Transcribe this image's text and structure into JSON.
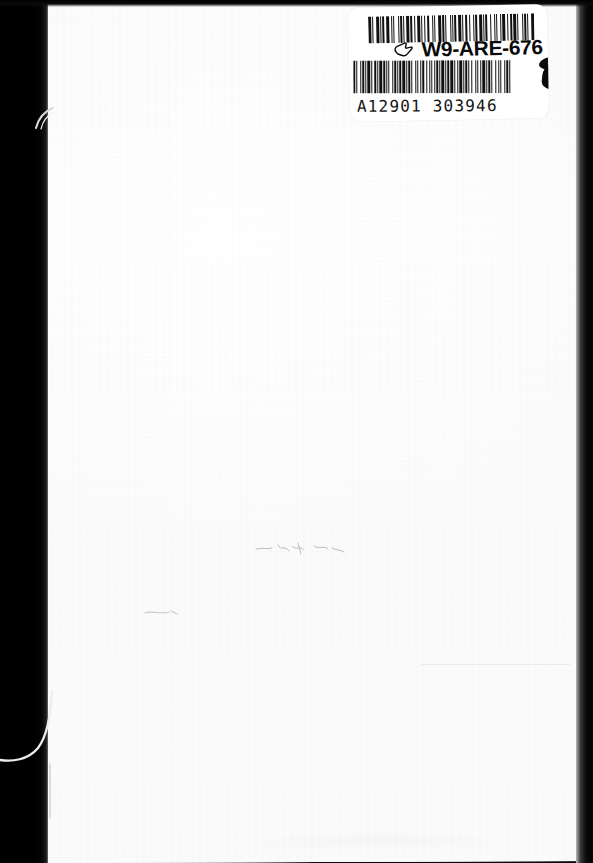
{
  "document": {
    "kind": "scanned-book-cover",
    "page_background": "#fdfdfd",
    "shadow_color": "#000000"
  },
  "label": {
    "background": "#ffffff",
    "code_text": "W9-ARE-676",
    "code_color": "#0a0a0a",
    "number_text": "A12901  303946",
    "number_color": "#151515",
    "hand_icon_name": "pointing-hand-icon",
    "barcodes": [
      {
        "name": "upper-barcode",
        "symbology": "code-39",
        "encoded_value": "W9-ARE-676",
        "bar_color": "#111111",
        "pattern": [
          3,
          1,
          1,
          2,
          3,
          1,
          1,
          1,
          2,
          1,
          3,
          2,
          1,
          1,
          1,
          3,
          1,
          1,
          2,
          1,
          1,
          1,
          3,
          1,
          2,
          2,
          1,
          1,
          3,
          1,
          1,
          2,
          1,
          1,
          2,
          3,
          1,
          1,
          1,
          2,
          3,
          1,
          2,
          1,
          1,
          3,
          1,
          1,
          1,
          1,
          2,
          1,
          3,
          1,
          1,
          2,
          2,
          1,
          1,
          3,
          1,
          1,
          2,
          1,
          3,
          1,
          1,
          1,
          2,
          2,
          1,
          3,
          1,
          1,
          1,
          2,
          1,
          1,
          3,
          2,
          1,
          1,
          2,
          1,
          3,
          1,
          1,
          3,
          1,
          1,
          2,
          1,
          1,
          2,
          3
        ]
      },
      {
        "name": "lower-barcode",
        "symbology": "code-39",
        "encoded_value": "A12901 303946",
        "bar_color": "#111111",
        "pattern": [
          2,
          1,
          1,
          3,
          1,
          1,
          2,
          1,
          1,
          1,
          3,
          1,
          1,
          2,
          2,
          1,
          1,
          1,
          3,
          1,
          2,
          1,
          1,
          1,
          1,
          3,
          1,
          1,
          2,
          1,
          1,
          1,
          2,
          1,
          3,
          1,
          1,
          1,
          2,
          1,
          1,
          3,
          1,
          1,
          1,
          2,
          1,
          1,
          3,
          1,
          1,
          2,
          1,
          1,
          1,
          3,
          1,
          1,
          2,
          1,
          1,
          1,
          3,
          1,
          1,
          1,
          2,
          1,
          3,
          1,
          1,
          2,
          1,
          1,
          3,
          1,
          1,
          1,
          2,
          1,
          1,
          2,
          1,
          3,
          1,
          1,
          1,
          2,
          1,
          1,
          3,
          1,
          1,
          1,
          2,
          1,
          1,
          3,
          1,
          2,
          1,
          1,
          1,
          3,
          1,
          1,
          2,
          1,
          1,
          1
        ]
      }
    ],
    "ink_blot": {
      "name": "ink-blot",
      "color": "#0b0b0b",
      "note": "black smear obscuring part of the lower barcode"
    }
  },
  "artifacts": {
    "left_gutter": "scanner shadow band along the left edge",
    "right_edge": "dark strip along the right edge",
    "fibres": [
      {
        "name": "fibre-top",
        "position": "upper-left gutter"
      },
      {
        "name": "fibre-bottom",
        "position": "lower-left gutter"
      }
    ],
    "faint_marks": [
      {
        "name": "faint-mark-a",
        "note": "faded handwriting trace, mid page"
      },
      {
        "name": "faint-mark-b",
        "note": "faded smudge, lower-left of centre"
      },
      {
        "name": "faint-rule",
        "note": "faint horizontal line, lower right"
      }
    ]
  }
}
